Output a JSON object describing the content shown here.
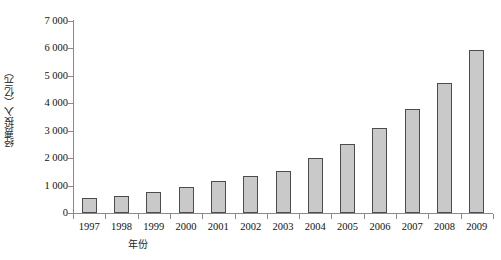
{
  "chart_data": {
    "type": "bar",
    "title": "",
    "subtitle": "",
    "xlabel": "年份",
    "ylabel": "经费投入（亿元）",
    "categories": [
      "1997",
      "1998",
      "1999",
      "2000",
      "2001",
      "2002",
      "2003",
      "2004",
      "2005",
      "2006",
      "2007",
      "2008",
      "2009"
    ],
    "values": [
      550,
      620,
      750,
      950,
      1150,
      1340,
      1550,
      2000,
      2500,
      3100,
      3800,
      4730,
      5950
    ],
    "ylim": [
      0,
      7000
    ],
    "yticks": [
      0,
      1000,
      2000,
      3000,
      4000,
      5000,
      6000,
      7000
    ],
    "ytick_labels": [
      "0",
      "1 000",
      "2 000",
      "3 000",
      "4 000",
      "5 000",
      "6 000",
      "7 000"
    ],
    "grid": false,
    "legend": false,
    "legend_position": "none",
    "series": [
      {
        "name": "经费投入",
        "values": [
          550,
          620,
          750,
          950,
          1150,
          1340,
          1550,
          2000,
          2500,
          3100,
          3800,
          4730,
          5950
        ]
      }
    ]
  },
  "style": {
    "bar_fill": "#c9c9c9",
    "bar_stroke": "#4c4c4c",
    "axis_color": "#8a8a8a",
    "text_color": "#111111",
    "background": "#ffffff"
  }
}
